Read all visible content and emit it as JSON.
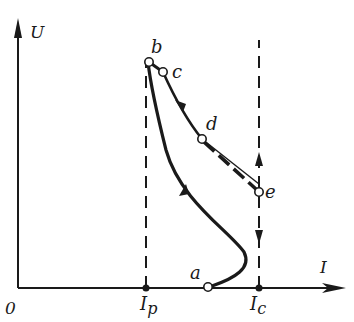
{
  "diagram": {
    "axes": {
      "y_label": "U",
      "x_label": "I",
      "origin_label": "0"
    },
    "markers": {
      "ip_label": "I",
      "ip_sub": "p",
      "ic_label": "I",
      "ic_sub": "c"
    },
    "points": {
      "a": "a",
      "b": "b",
      "c": "c",
      "d": "d",
      "e": "e"
    },
    "colors": {
      "ink": "#1a1a1a",
      "background": "#ffffff"
    }
  }
}
